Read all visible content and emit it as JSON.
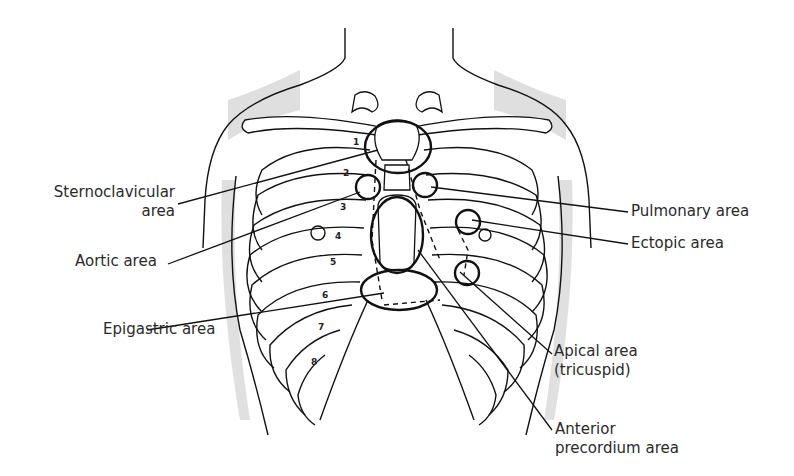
{
  "diagram": {
    "labels": {
      "sternoclavicular": [
        "Sternoclavicular",
        "area"
      ],
      "aortic": "Aortic area",
      "epigastric": "Epigastric area",
      "pulmonary": "Pulmonary area",
      "ectopic": "Ectopic area",
      "apical": [
        "Apical area",
        "(tricuspid)"
      ],
      "anterior_precordium": [
        "Anterior",
        "precordium area"
      ]
    },
    "rib_numbers": [
      "1",
      "2",
      "3",
      "4",
      "5",
      "6",
      "7",
      "8"
    ],
    "colors": {
      "line": "#111111",
      "text": "#2a2a2a",
      "background": "#ffffff"
    }
  }
}
